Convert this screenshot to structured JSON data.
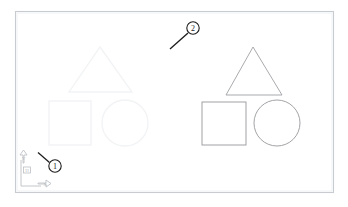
{
  "drawing": {
    "title": "CAD drawing viewport",
    "background_color": "#ffffff",
    "border": {
      "name": "drawing-frame",
      "color": "#c8cbd0",
      "x": 15,
      "y": 11,
      "width": 319,
      "height": 182,
      "stroke_width": 1.1
    },
    "groups": [
      {
        "id": "left-group",
        "label": "Original shapes (faded)",
        "color": "#f1f2f4",
        "stroke_width": 1,
        "shapes": [
          {
            "type": "triangle",
            "name": "left-triangle",
            "points": "100,47 132,92 69,92"
          },
          {
            "type": "square",
            "name": "left-square",
            "x": 49,
            "y": 101,
            "width": 42,
            "height": 44
          },
          {
            "type": "circle",
            "name": "left-circle",
            "cx": 125,
            "cy": 123,
            "r": 23
          }
        ]
      },
      {
        "id": "right-group",
        "label": "Copied shapes",
        "color": "#98999c",
        "stroke_width": 0.9,
        "shapes": [
          {
            "type": "triangle",
            "name": "right-triangle",
            "points": "253,47 282,95 226,95"
          },
          {
            "type": "square",
            "name": "right-square",
            "x": 202,
            "y": 102,
            "width": 44,
            "height": 43
          },
          {
            "type": "circle",
            "name": "right-circle",
            "cx": 277,
            "cy": 123,
            "r": 23
          }
        ]
      }
    ],
    "callouts": [
      {
        "id": "callout-1",
        "label": "1",
        "cx": 55,
        "cy": 166,
        "r": 6.2,
        "leader_x1": 49.5,
        "leader_y1": 162.5,
        "leader_x2": 38,
        "leader_y2": 152.5,
        "color": "#1b1b1b"
      },
      {
        "id": "callout-2",
        "label": "2",
        "cx": 193,
        "cy": 28,
        "r": 6.2,
        "leader_x1": 188,
        "leader_y1": 33,
        "leader_x2": 170,
        "leader_y2": 49,
        "color": "#1b1b1b"
      }
    ],
    "ucs_icon": {
      "name": "ucs-axis-icon",
      "color": "#b9bcc1",
      "origin_x": 21,
      "origin_y": 186,
      "x_axis_label": "X",
      "y_axis_label": "Y",
      "origin_marker_label": "H"
    }
  }
}
